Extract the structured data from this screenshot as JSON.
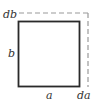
{
  "diagram": {
    "labels": {
      "top_left": "db",
      "left": "b",
      "bottom": "a",
      "bottom_right": "da"
    },
    "colors": {
      "solid_rect": "#2a2a2a",
      "dashed_rect": "#9a9a9a",
      "label": "#333333",
      "background": "#ffffff"
    }
  }
}
